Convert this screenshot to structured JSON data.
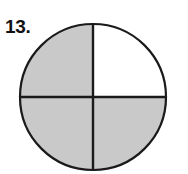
{
  "figure": {
    "problem_number": "13.",
    "kind": "fraction-circle",
    "colors": {
      "background": "#ffffff",
      "shaded_fill": "#c9c9c9",
      "unshaded_fill": "#ffffff",
      "outline": "#1a1a1a",
      "divider": "#1a1a1a",
      "label_text": "#111111"
    },
    "geometry": {
      "center_x": 93,
      "center_y": 97,
      "radius": 73,
      "outline_width": 2.2,
      "divider_width": 2.4
    },
    "segments": [
      {
        "name": "top-left-quarter",
        "shaded": true,
        "shade_label": "shaded"
      },
      {
        "name": "top-right-quarter",
        "shaded": false,
        "shade_label": "unshaded"
      },
      {
        "name": "bottom-right-quarter",
        "shaded": true,
        "shade_label": "shaded"
      },
      {
        "name": "bottom-left-quarter",
        "shaded": true,
        "shade_label": "shaded"
      }
    ],
    "dividers": [
      {
        "name": "vertical-diameter",
        "orientation": "vertical"
      },
      {
        "name": "horizontal-diameter",
        "orientation": "horizontal"
      }
    ]
  },
  "chart_data": {
    "type": "pie",
    "title": "",
    "subtitle": "",
    "xlabel": "",
    "ylabel": "",
    "legend": [],
    "legend_position": "none",
    "grid": false,
    "total_parts": 4,
    "shaded_parts": 3,
    "fraction": "3/4",
    "fraction_decimal": 0.75,
    "categories": [
      "top-left",
      "top-right",
      "bottom-right",
      "bottom-left"
    ],
    "values": [
      25,
      25,
      25,
      25
    ],
    "slice_shaded": [
      true,
      false,
      true,
      true
    ],
    "annotations": [
      "13."
    ]
  }
}
